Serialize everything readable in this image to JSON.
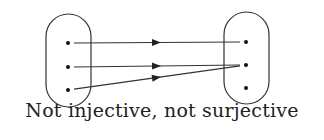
{
  "caption": "Not injective, not surjective",
  "domain_set": {
    "name": "domain",
    "elements": [
      "a1",
      "a2",
      "a3"
    ]
  },
  "codomain_set": {
    "name": "codomain",
    "elements": [
      "b1",
      "b2",
      "b3"
    ]
  },
  "mappings": [
    {
      "from": 0,
      "to": 0
    },
    {
      "from": 1,
      "to": 1
    },
    {
      "from": 2,
      "to": 1
    }
  ],
  "colors": {
    "stroke": "#333333",
    "dot": "#111111"
  }
}
